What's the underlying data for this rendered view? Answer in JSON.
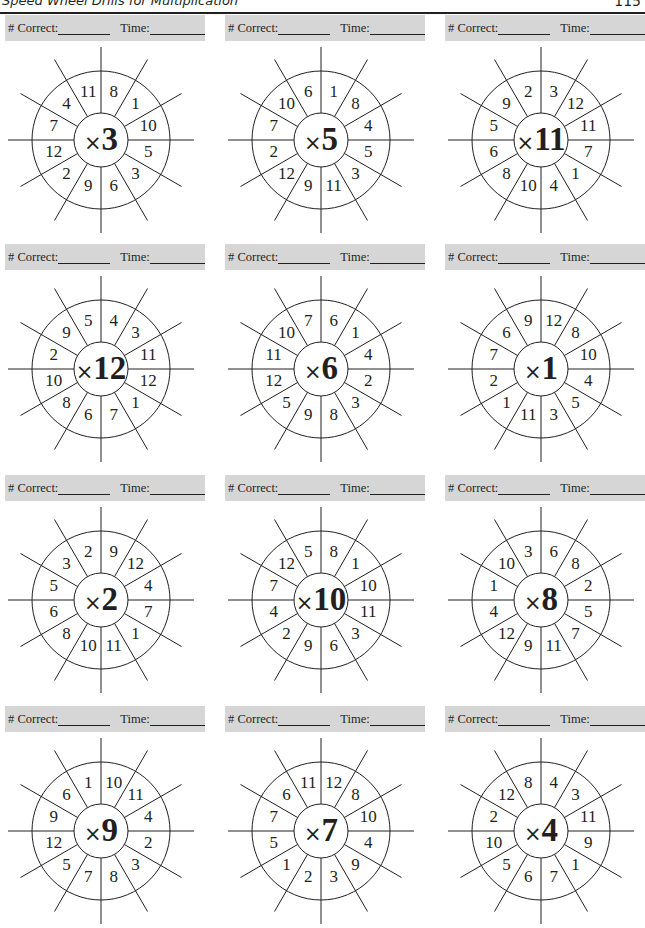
{
  "header": {
    "title": "Speed Wheel Drills for Multiplication",
    "page_number": "115"
  },
  "score_bar": {
    "correct_label": "# Correct:",
    "time_label": "Time:"
  },
  "wheel_layout_note": "segment values listed clockwise starting at the segment just right of 12 o'clock",
  "wheels": [
    {
      "operator": "×",
      "factor": "3",
      "values": [
        "8",
        "1",
        "10",
        "5",
        "3",
        "6",
        "9",
        "2",
        "12",
        "7",
        "4",
        "11"
      ]
    },
    {
      "operator": "×",
      "factor": "5",
      "values": [
        "1",
        "8",
        "4",
        "5",
        "3",
        "11",
        "9",
        "12",
        "2",
        "7",
        "10",
        "6"
      ]
    },
    {
      "operator": "×",
      "factor": "11",
      "values": [
        "3",
        "12",
        "11",
        "7",
        "1",
        "4",
        "10",
        "8",
        "6",
        "5",
        "9",
        "2"
      ]
    },
    {
      "operator": "×",
      "factor": "12",
      "values": [
        "4",
        "3",
        "11",
        "12",
        "1",
        "7",
        "6",
        "8",
        "10",
        "2",
        "9",
        "5"
      ]
    },
    {
      "operator": "×",
      "factor": "6",
      "values": [
        "6",
        "1",
        "4",
        "2",
        "3",
        "8",
        "9",
        "5",
        "12",
        "11",
        "10",
        "7"
      ]
    },
    {
      "operator": "×",
      "factor": "1",
      "values": [
        "12",
        "8",
        "10",
        "4",
        "5",
        "3",
        "11",
        "1",
        "2",
        "7",
        "6",
        "9"
      ]
    },
    {
      "operator": "×",
      "factor": "2",
      "values": [
        "9",
        "12",
        "4",
        "7",
        "1",
        "11",
        "10",
        "8",
        "6",
        "5",
        "3",
        "2"
      ]
    },
    {
      "operator": "×",
      "factor": "10",
      "values": [
        "8",
        "1",
        "10",
        "11",
        "3",
        "6",
        "9",
        "2",
        "4",
        "7",
        "12",
        "5"
      ]
    },
    {
      "operator": "×",
      "factor": "8",
      "values": [
        "6",
        "8",
        "2",
        "5",
        "7",
        "11",
        "9",
        "12",
        "4",
        "1",
        "10",
        "3"
      ]
    },
    {
      "operator": "×",
      "factor": "9",
      "values": [
        "10",
        "11",
        "4",
        "2",
        "3",
        "8",
        "7",
        "5",
        "12",
        "9",
        "6",
        "1"
      ]
    },
    {
      "operator": "×",
      "factor": "7",
      "values": [
        "12",
        "8",
        "10",
        "4",
        "9",
        "3",
        "2",
        "1",
        "5",
        "7",
        "6",
        "11"
      ]
    },
    {
      "operator": "×",
      "factor": "4",
      "values": [
        "4",
        "3",
        "11",
        "9",
        "1",
        "7",
        "6",
        "5",
        "10",
        "2",
        "12",
        "8"
      ]
    }
  ],
  "colors": {
    "ink": "#231f20",
    "score_bar_bg": "#d6d6d6",
    "paper": "#ffffff"
  }
}
